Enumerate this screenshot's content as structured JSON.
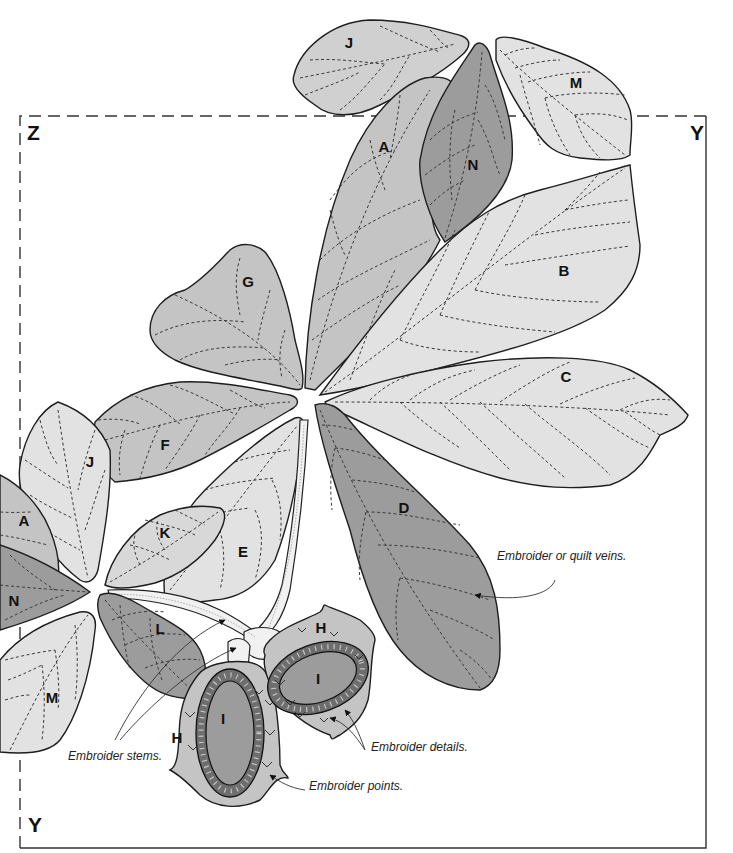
{
  "corners": {
    "top_left": "Z",
    "top_right": "Y",
    "bottom_left": "Y"
  },
  "colors": {
    "light": "#e2e2e2",
    "medium": "#c4c4c4",
    "dark": "#9c9c9c",
    "outline": "#1e1e1e",
    "background": "#ffffff"
  },
  "pieces": [
    {
      "id": "J",
      "shade": "medium",
      "position": "top, above frame"
    },
    {
      "id": "M",
      "shade": "light",
      "position": "top right, above frame"
    },
    {
      "id": "A",
      "shade": "medium",
      "position": "upper center"
    },
    {
      "id": "N",
      "shade": "dark",
      "position": "upper center, over A"
    },
    {
      "id": "B",
      "shade": "light",
      "position": "right"
    },
    {
      "id": "G",
      "shade": "medium",
      "position": "center left"
    },
    {
      "id": "C",
      "shade": "light",
      "position": "right, middle"
    },
    {
      "id": "F",
      "shade": "medium",
      "position": "left, middle"
    },
    {
      "id": "D",
      "shade": "dark",
      "position": "lower center right"
    },
    {
      "id": "E",
      "shade": "light",
      "position": "lower center"
    },
    {
      "id": "K",
      "shade": "light",
      "position": "lower left"
    },
    {
      "id": "J",
      "shade": "light",
      "position": "far left, middle"
    },
    {
      "id": "A",
      "shade": "medium",
      "position": "far left edge"
    },
    {
      "id": "N",
      "shade": "dark",
      "position": "far left edge"
    },
    {
      "id": "L",
      "shade": "dark",
      "position": "lower left"
    },
    {
      "id": "M",
      "shade": "light",
      "position": "bottom left"
    },
    {
      "id": "H",
      "shade": "medium",
      "position": "bottom, left berry"
    },
    {
      "id": "I",
      "shade": "dark",
      "position": "bottom, left berry center"
    },
    {
      "id": "H",
      "shade": "medium",
      "position": "bottom, right berry"
    },
    {
      "id": "I",
      "shade": "dark",
      "position": "bottom, right berry center"
    }
  ],
  "labels": {
    "J_top": "J",
    "M_top": "M",
    "A_top": "A",
    "N_top": "N",
    "B": "B",
    "G": "G",
    "C": "C",
    "F": "F",
    "D": "D",
    "E": "E",
    "K": "K",
    "J_left": "J",
    "A_left": "A",
    "N_left": "N",
    "L": "L",
    "M_bottom": "M",
    "H_left": "H",
    "I_left": "I",
    "H_right": "H",
    "I_right": "I"
  },
  "annotations": {
    "veins": "Embroider or quilt veins.",
    "stems": "Embroider stems.",
    "details": "Embroider details.",
    "points": "Embroider points."
  }
}
